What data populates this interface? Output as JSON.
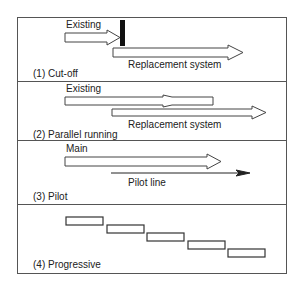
{
  "panels": [
    {
      "id": "cut-off",
      "caption": "(1) Cut-off",
      "labels": {
        "old": "Existing",
        "new": "Replacement system"
      }
    },
    {
      "id": "parallel-running",
      "caption": "(2) Parallel running",
      "labels": {
        "old": "Existing",
        "new": "Replacement system"
      }
    },
    {
      "id": "pilot",
      "caption": "(3) Pilot",
      "labels": {
        "old": "Main",
        "new": "Pilot line"
      }
    },
    {
      "id": "progressive",
      "caption": "(4) Progressive",
      "stages": 5
    }
  ],
  "colors": {
    "stroke": "#444444",
    "bar": "#111111",
    "background": "#ffffff"
  }
}
